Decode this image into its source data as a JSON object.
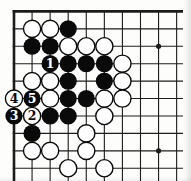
{
  "diagram": {
    "kind": "go-board-corner-diagram",
    "background_color": "#fdfdfc",
    "line_color": "#1c1c1c",
    "grid": {
      "cols": 10,
      "rows": 10,
      "origin_x": 14,
      "origin_y": 11.4,
      "dx": 18.07,
      "dy": 17.43,
      "edge_thick_width": 2.6,
      "thin_line_width": 1.1,
      "h_line_end_x": 183,
      "v_line_end_y": 181
    },
    "star_points": [
      {
        "col": 8,
        "row": 2
      },
      {
        "col": 8,
        "row": 8
      }
    ],
    "star_radius": 2.6,
    "stone_radius": 8.6,
    "stone_colors": {
      "black_fill": "#0a0a0a",
      "white_fill": "#ffffff",
      "white_stroke": "#0a0a0a",
      "white_stroke_width": 1.4
    },
    "move_labels": {
      "font_size": 12.5,
      "label_on_black_color": "#ffffff",
      "label_on_white_color": "#0a0a0a"
    },
    "stones": [
      {
        "col": 1,
        "row": 1,
        "color": "white"
      },
      {
        "col": 2,
        "row": 1,
        "color": "white"
      },
      {
        "col": 3,
        "row": 1,
        "color": "black"
      },
      {
        "col": 1,
        "row": 2,
        "color": "black"
      },
      {
        "col": 2,
        "row": 2,
        "color": "black"
      },
      {
        "col": 3,
        "row": 2,
        "color": "white"
      },
      {
        "col": 4,
        "row": 2,
        "color": "white"
      },
      {
        "col": 5,
        "row": 2,
        "color": "white"
      },
      {
        "col": 2,
        "row": 3,
        "color": "black",
        "label": "1"
      },
      {
        "col": 3,
        "row": 3,
        "color": "black"
      },
      {
        "col": 4,
        "row": 3,
        "color": "black"
      },
      {
        "col": 5,
        "row": 3,
        "color": "black"
      },
      {
        "col": 6,
        "row": 3,
        "color": "white"
      },
      {
        "col": 1,
        "row": 4,
        "color": "white"
      },
      {
        "col": 2,
        "row": 4,
        "color": "white"
      },
      {
        "col": 3,
        "row": 4,
        "color": "black"
      },
      {
        "col": 5,
        "row": 4,
        "color": "black"
      },
      {
        "col": 6,
        "row": 4,
        "color": "white"
      },
      {
        "col": 0,
        "row": 5,
        "color": "white",
        "label": "4"
      },
      {
        "col": 1,
        "row": 5,
        "color": "black",
        "label": "5"
      },
      {
        "col": 2,
        "row": 5,
        "color": "white"
      },
      {
        "col": 3,
        "row": 5,
        "color": "black"
      },
      {
        "col": 4,
        "row": 5,
        "color": "black"
      },
      {
        "col": 5,
        "row": 5,
        "color": "white"
      },
      {
        "col": 6,
        "row": 5,
        "color": "white"
      },
      {
        "col": 0,
        "row": 6,
        "color": "black",
        "label": "3"
      },
      {
        "col": 1,
        "row": 6,
        "color": "white",
        "label": "2"
      },
      {
        "col": 2,
        "row": 6,
        "color": "black"
      },
      {
        "col": 3,
        "row": 6,
        "color": "black"
      },
      {
        "col": 5,
        "row": 6,
        "color": "white"
      },
      {
        "col": 1,
        "row": 7,
        "color": "black"
      },
      {
        "col": 4,
        "row": 7,
        "color": "white"
      },
      {
        "col": 1,
        "row": 8,
        "color": "white"
      },
      {
        "col": 2,
        "row": 8,
        "color": "white"
      },
      {
        "col": 4,
        "row": 8,
        "color": "white"
      },
      {
        "col": 3,
        "row": 9,
        "color": "white"
      },
      {
        "col": 5,
        "row": 9,
        "color": "white"
      }
    ]
  }
}
